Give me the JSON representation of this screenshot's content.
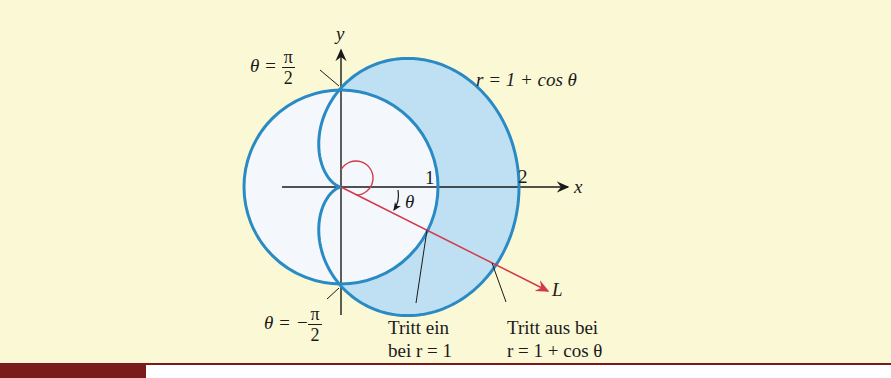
{
  "figure": {
    "axes": {
      "x_label": "x",
      "y_label": "y",
      "tick_1": "1",
      "tick_2": "2"
    },
    "curves": {
      "circle": {
        "equation": "r = 1"
      },
      "cardioid": {
        "label": "r = 1 + cos θ"
      }
    },
    "ray": {
      "label": "L",
      "angle_label": "θ"
    },
    "annotations": {
      "theta_top": {
        "lhs": "θ = ",
        "num": "π",
        "den": "2"
      },
      "theta_bottom": {
        "lhs": "θ = −",
        "num": "π",
        "den": "2"
      },
      "enter": {
        "line1": "Tritt ein",
        "line2": "bei r = 1"
      },
      "exit": {
        "line1": "Tritt aus bei",
        "line2": "r = 1 + cos θ"
      }
    },
    "colors": {
      "background": "#fbf8d6",
      "curve_stroke": "#2a8ac4",
      "shaded_region": "#bfe0f3",
      "inner_region": "#f4f8fc",
      "ray": "#d23a4a",
      "axis": "#1a1a1a",
      "footer_bar": "#7a1c1c"
    }
  }
}
